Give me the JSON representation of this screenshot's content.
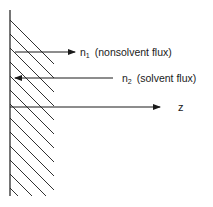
{
  "diagram": {
    "colors": {
      "ink": "#1a1a1a",
      "background": "#ffffff"
    },
    "wall": {
      "label": "hatched boundary (membrane surface)"
    },
    "arrows": [
      {
        "id": "n1",
        "symbol": "n",
        "subscript": "1",
        "description": "(nonsolvent flux)",
        "direction": "right"
      },
      {
        "id": "n2",
        "symbol": "n",
        "subscript": "2",
        "description": "(solvent flux)",
        "direction": "left"
      }
    ],
    "axis": {
      "label": "z",
      "direction": "right"
    }
  }
}
